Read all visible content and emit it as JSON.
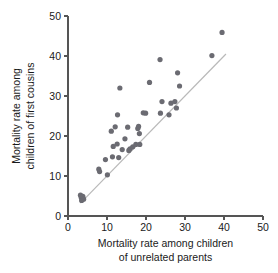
{
  "chart_data": {
    "type": "scatter",
    "title": "",
    "xlabel": "Mortality rate among children of unrelated parents",
    "xlabel_line1": "Mortality rate among children",
    "xlabel_line2": "of unrelated parents",
    "ylabel": "Mortality rate among children of first cousins",
    "ylabel_line1": "Mortality rate among",
    "ylabel_line2": "children of first cousins",
    "xlim": [
      0,
      50
    ],
    "ylim": [
      0,
      50
    ],
    "xticks": [
      0,
      10,
      20,
      30,
      40,
      50
    ],
    "yticks": [
      0,
      10,
      20,
      30,
      40,
      50
    ],
    "xtick_labels": [
      "0",
      "10",
      "20",
      "30",
      "40",
      "50"
    ],
    "ytick_labels": [
      "0",
      "10",
      "20",
      "30",
      "40",
      "50"
    ],
    "grid": false,
    "legend": null,
    "point_color": "#6b6b72",
    "point_radius": 2.6,
    "reference_line": {
      "name": "identity-line",
      "color": "#b9b9b9",
      "x": [
        3.2,
        40.5
      ],
      "y": [
        3.2,
        40.5
      ]
    },
    "points": [
      {
        "x": 3.2,
        "y": 5.2
      },
      {
        "x": 3.4,
        "y": 4.6
      },
      {
        "x": 3.5,
        "y": 3.9
      },
      {
        "x": 3.8,
        "y": 4.9
      },
      {
        "x": 4.0,
        "y": 4.2
      },
      {
        "x": 7.9,
        "y": 11.7
      },
      {
        "x": 8.1,
        "y": 11.1
      },
      {
        "x": 9.6,
        "y": 14.1
      },
      {
        "x": 10.1,
        "y": 10.3
      },
      {
        "x": 11.1,
        "y": 21.2
      },
      {
        "x": 11.4,
        "y": 14.8
      },
      {
        "x": 11.6,
        "y": 17.4
      },
      {
        "x": 12.1,
        "y": 22.3
      },
      {
        "x": 12.6,
        "y": 18.0
      },
      {
        "x": 12.7,
        "y": 25.3
      },
      {
        "x": 13.0,
        "y": 14.6
      },
      {
        "x": 13.3,
        "y": 32.0
      },
      {
        "x": 13.9,
        "y": 16.6
      },
      {
        "x": 14.6,
        "y": 19.3
      },
      {
        "x": 15.3,
        "y": 22.2
      },
      {
        "x": 15.6,
        "y": 16.4
      },
      {
        "x": 15.9,
        "y": 16.8
      },
      {
        "x": 16.6,
        "y": 17.3
      },
      {
        "x": 17.4,
        "y": 17.9
      },
      {
        "x": 17.9,
        "y": 21.9
      },
      {
        "x": 18.1,
        "y": 22.4
      },
      {
        "x": 18.3,
        "y": 20.6
      },
      {
        "x": 18.4,
        "y": 17.9
      },
      {
        "x": 19.3,
        "y": 25.8
      },
      {
        "x": 19.9,
        "y": 25.7
      },
      {
        "x": 20.9,
        "y": 33.4
      },
      {
        "x": 23.6,
        "y": 39.1
      },
      {
        "x": 23.7,
        "y": 25.7
      },
      {
        "x": 24.1,
        "y": 28.6
      },
      {
        "x": 25.9,
        "y": 25.3
      },
      {
        "x": 26.4,
        "y": 28.2
      },
      {
        "x": 27.4,
        "y": 28.6
      },
      {
        "x": 27.8,
        "y": 27.0
      },
      {
        "x": 28.1,
        "y": 35.8
      },
      {
        "x": 28.6,
        "y": 32.5
      },
      {
        "x": 36.9,
        "y": 40.1
      },
      {
        "x": 39.5,
        "y": 45.9
      }
    ]
  }
}
